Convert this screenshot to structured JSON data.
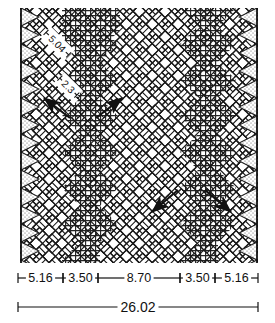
{
  "drawing": {
    "title": "Herringbone paver pattern plan",
    "units_implied": "inches",
    "colors": {
      "line": "#1a1a1a",
      "paver_fill": "#ffffff",
      "crosshatch_fill": "#ffffff",
      "crosshatch_line": "#262626",
      "stipple_dot": "#555555",
      "background": "#ffffff"
    },
    "border": {
      "left_edge_line": true,
      "right_edge_line": true
    },
    "rotated_labels": [
      {
        "text": "5.04",
        "rotation_deg": 45,
        "x": 57,
        "y": 44
      },
      {
        "text": "2.3",
        "rotation_deg": 45,
        "x": 68,
        "y": 87
      }
    ],
    "arrows": [
      {
        "name": "arrow-upper-left",
        "direction": "up-left",
        "x": 50,
        "y": 105
      },
      {
        "name": "arrow-upper-right",
        "direction": "up-right",
        "x": 115,
        "y": 105
      },
      {
        "name": "arrow-lower-left",
        "direction": "down-left",
        "x": 158,
        "y": 205
      },
      {
        "name": "arrow-lower-right",
        "direction": "down-right",
        "x": 225,
        "y": 205
      }
    ]
  },
  "dimensions": {
    "segment_row": {
      "y": 278,
      "segments": [
        {
          "label": "5.16",
          "x_start": 18,
          "x_end": 63
        },
        {
          "label": "3.50",
          "x_start": 63,
          "x_end": 98
        },
        {
          "label": "8.70",
          "x_start": 98,
          "x_end": 180
        },
        {
          "label": "3.50",
          "x_start": 180,
          "x_end": 215
        },
        {
          "label": "5.16",
          "x_start": 215,
          "x_end": 258
        }
      ]
    },
    "total_row": {
      "y": 307,
      "label": "26.02",
      "x_start": 18,
      "x_end": 258
    }
  },
  "chart_data": {
    "type": "table",
    "categories": [
      "5.16",
      "3.50",
      "8.70",
      "3.50",
      "5.16"
    ],
    "values": [
      5.16,
      3.5,
      8.7,
      3.5,
      5.16
    ],
    "total": 26.02,
    "angled_callouts": [
      "5.04",
      "2.3"
    ],
    "xlabel": "",
    "ylabel": ""
  }
}
